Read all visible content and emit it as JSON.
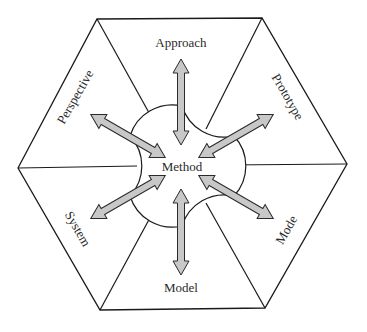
{
  "diagram": {
    "type": "hexagonal-concept-diagram",
    "center_label": "Method",
    "segments": [
      {
        "id": "approach",
        "label": "Approach",
        "position": "top"
      },
      {
        "id": "prototype",
        "label": "Prototype",
        "position": "upper-right"
      },
      {
        "id": "mode",
        "label": "Mode",
        "position": "lower-right"
      },
      {
        "id": "model",
        "label": "Model",
        "position": "bottom"
      },
      {
        "id": "system",
        "label": "System",
        "position": "lower-left"
      },
      {
        "id": "perspective",
        "label": "Perspective",
        "position": "upper-left"
      }
    ],
    "arrows": "double-headed arrows linking Method with each segment",
    "colors": {
      "line": "#1a1a1a",
      "arrow_fill": "#c8c8c8",
      "arrow_stroke": "#2a2a2a",
      "background": "#ffffff",
      "text": "#2a2a2a"
    }
  }
}
